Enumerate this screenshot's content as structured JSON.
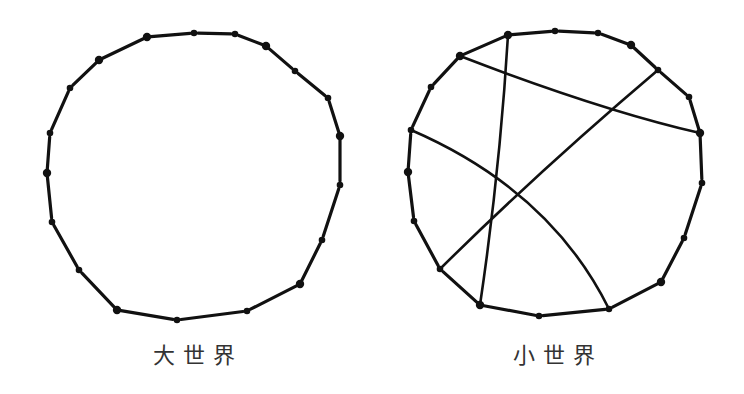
{
  "diagrams": [
    {
      "id": "large-world",
      "label": "大世界",
      "nodes": [
        [
          147,
          37
        ],
        [
          194,
          33
        ],
        [
          235,
          34
        ],
        [
          266,
          46
        ],
        [
          295,
          71
        ],
        [
          328,
          98
        ],
        [
          340,
          136
        ],
        [
          340,
          185
        ],
        [
          322,
          240
        ],
        [
          300,
          284
        ],
        [
          247,
          311
        ],
        [
          177,
          320
        ],
        [
          117,
          310
        ],
        [
          79,
          270
        ],
        [
          52,
          222
        ],
        [
          47,
          173
        ],
        [
          50,
          133
        ],
        [
          70,
          88
        ],
        [
          99,
          60
        ]
      ],
      "chords": []
    },
    {
      "id": "small-world",
      "label": "小世界",
      "nodes": [
        [
          508,
          35
        ],
        [
          555,
          31
        ],
        [
          598,
          33
        ],
        [
          631,
          45
        ],
        [
          658,
          70
        ],
        [
          689,
          97
        ],
        [
          700,
          133
        ],
        [
          702,
          183
        ],
        [
          684,
          238
        ],
        [
          661,
          282
        ],
        [
          609,
          309
        ],
        [
          539,
          316
        ],
        [
          480,
          305
        ],
        [
          440,
          269
        ],
        [
          414,
          221
        ],
        [
          408,
          172
        ],
        [
          411,
          130
        ],
        [
          431,
          87
        ],
        [
          460,
          56
        ]
      ],
      "chords": [
        {
          "from": [
            460,
            56
          ],
          "to": [
            700,
            133
          ],
          "ctrl": [
            600,
            110
          ]
        },
        {
          "from": [
            508,
            35
          ],
          "to": [
            480,
            305
          ],
          "ctrl": [
            500,
            170
          ]
        },
        {
          "from": [
            658,
            70
          ],
          "to": [
            440,
            269
          ],
          "ctrl": [
            540,
            170
          ]
        },
        {
          "from": [
            411,
            130
          ],
          "to": [
            609,
            309
          ],
          "ctrl": [
            550,
            190
          ]
        }
      ]
    }
  ],
  "colors": {
    "stroke": "#111111",
    "background": "#ffffff",
    "caption": "#333333"
  }
}
